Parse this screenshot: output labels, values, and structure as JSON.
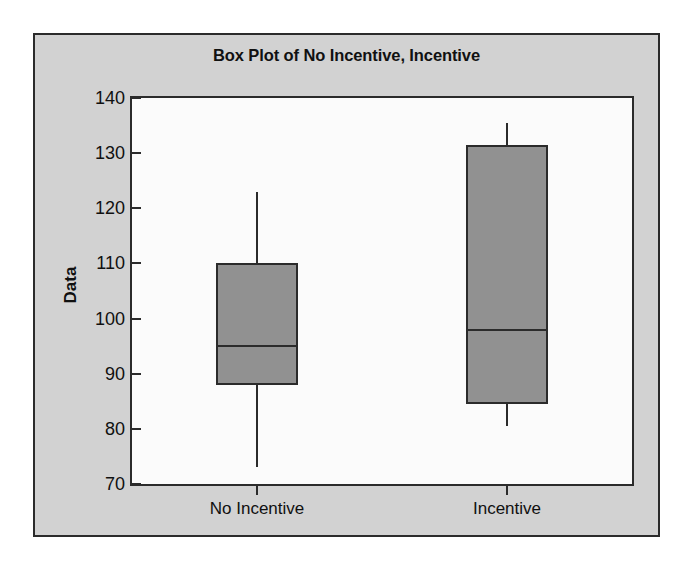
{
  "chart_data": {
    "type": "box",
    "title": "Box Plot of No Incentive, Incentive",
    "xlabel": "",
    "ylabel": "Data",
    "ylim": [
      70,
      140
    ],
    "yticks": [
      70,
      80,
      90,
      100,
      110,
      120,
      130,
      140
    ],
    "ytick_labels": [
      "70",
      "80",
      "90",
      "100",
      "110",
      "120",
      "130",
      "140"
    ],
    "grid": false,
    "legend": false,
    "categories": [
      "No Incentive",
      "Incentive"
    ],
    "boxes": [
      {
        "name": "No Incentive",
        "whisker_low": 73,
        "q1": 88,
        "median": 95,
        "q3": 110,
        "whisker_high": 123,
        "outliers": []
      },
      {
        "name": "Incentive",
        "whisker_low": 80.5,
        "q1": 84.5,
        "median": 98,
        "q3": 131.5,
        "whisker_high": 135.5,
        "outliers": []
      }
    ],
    "colors": {
      "box_fill": "#919191",
      "box_edge": "#2b2b2b",
      "panel_background": "#d2d2d2",
      "plot_background": "#fbfbfb",
      "text": "#101010"
    }
  }
}
